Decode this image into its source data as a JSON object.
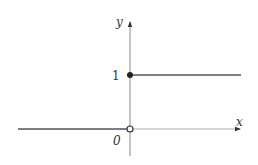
{
  "diagram": {
    "type": "step-function-graph",
    "axes": {
      "x_label": "x",
      "y_label": "y",
      "origin_label": "0"
    },
    "ticks": {
      "y_one_label": "1"
    },
    "function": {
      "segments": [
        {
          "from": "-inf",
          "to": 0,
          "y": 0,
          "left_endpoint": null,
          "right_endpoint": "open"
        },
        {
          "from": 0,
          "to": "inf",
          "y": 1,
          "left_endpoint": "closed",
          "right_endpoint": null
        }
      ]
    },
    "colors": {
      "line": "#555555",
      "axis": "#666666",
      "dot_fill": "#222222",
      "open_dot_fill": "#ffffff"
    }
  }
}
